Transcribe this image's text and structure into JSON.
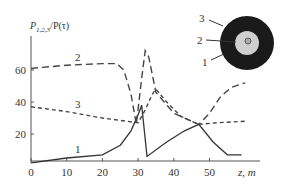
{
  "chart_data": {
    "type": "line",
    "title": "",
    "ylabel": "P_{1,2,3}/P(τ)",
    "ylabel_main": "P",
    "ylabel_sub": "1,2,3",
    "ylabel_tail": "/P(τ)",
    "xlabel": "z, m",
    "xlim": [
      0,
      62
    ],
    "ylim": [
      0,
      75
    ],
    "x_ticks": [
      0,
      10,
      20,
      30,
      40,
      50
    ],
    "x_tick_labels": [
      "0",
      "10",
      "20",
      "30",
      "40",
      "50"
    ],
    "y_ticks": [
      20,
      40,
      60
    ],
    "y_tick_labels": [
      "20",
      "40",
      "60"
    ],
    "grid": false,
    "legend": "inline curve numbers",
    "series": [
      {
        "name": "1",
        "style": "solid",
        "x": [
          0,
          10,
          20,
          25,
          28,
          30,
          31,
          32.5,
          38,
          43,
          47,
          51,
          55,
          59
        ],
        "y": [
          2,
          5,
          7,
          13,
          22,
          32,
          38,
          6,
          15,
          22,
          26,
          15,
          7,
          7
        ]
      },
      {
        "name": "2",
        "style": "long-dash",
        "x": [
          0,
          10,
          20,
          24,
          26,
          28,
          29.5,
          31,
          32,
          33,
          35,
          40,
          47,
          50,
          53,
          56,
          60
        ],
        "y": [
          61,
          63,
          64,
          64,
          60,
          45,
          26,
          55,
          72,
          68,
          46,
          33,
          26,
          33,
          43,
          49,
          52
        ]
      },
      {
        "name": "3",
        "style": "short-dash",
        "x": [
          0,
          10,
          20,
          30,
          32,
          34,
          35,
          38,
          42,
          47,
          52,
          60
        ],
        "y": [
          37,
          34,
          30,
          27,
          35,
          45,
          48,
          40,
          31,
          26,
          27,
          28
        ]
      }
    ],
    "annotations": [
      {
        "text": "1",
        "x": 14,
        "y": 9
      },
      {
        "text": "2",
        "x": 14,
        "y": 67
      },
      {
        "text": "3",
        "x": 14,
        "y": 38
      }
    ],
    "inset": {
      "description": "cross-section of coaxial structure",
      "labels": [
        "3",
        "2",
        "1"
      ]
    }
  }
}
